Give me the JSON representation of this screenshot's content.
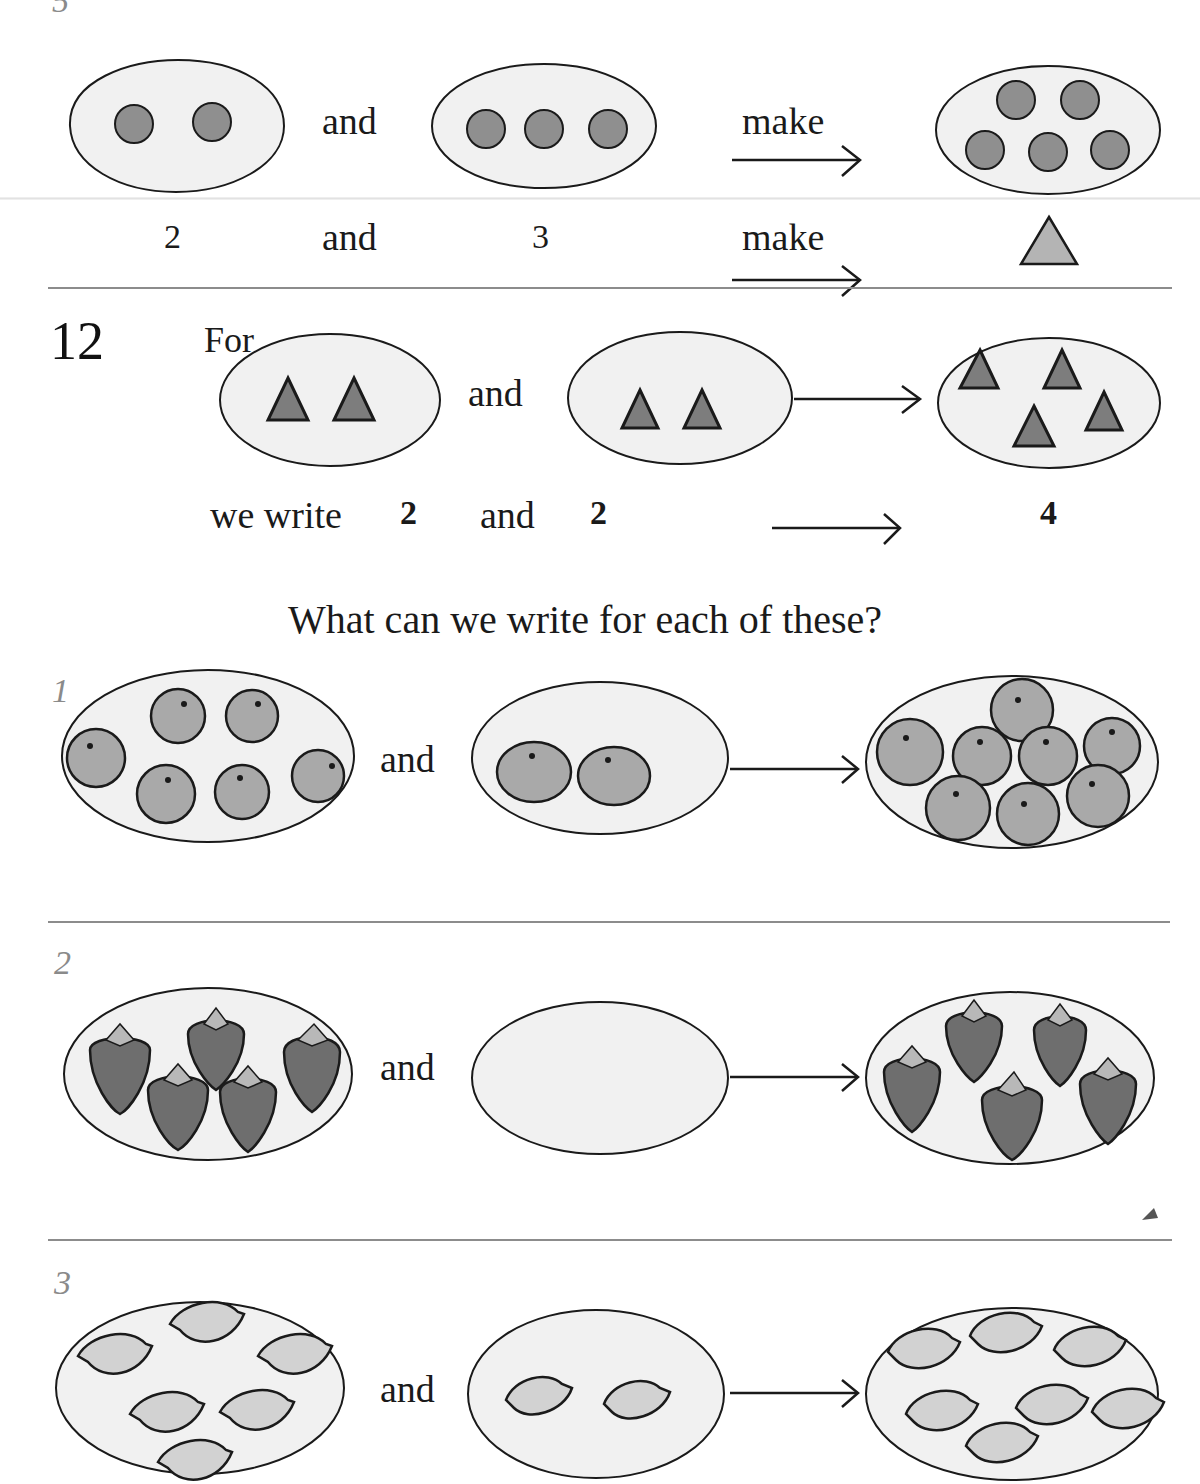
{
  "section_11_tail": {
    "label": "5",
    "row_pictures": {
      "left_count": 2,
      "joiner": "and",
      "middle_count": 3,
      "verb": "make",
      "result_count": 5,
      "object": "dot"
    },
    "row_numbers": {
      "left": "2",
      "joiner": "and",
      "middle": "3",
      "verb": "make",
      "result_symbol": "triangle-placeholder"
    }
  },
  "section_12": {
    "number": "12",
    "intro": "For",
    "joiner": "and",
    "pictures": {
      "left_count": 2,
      "middle_count": 2,
      "result_count": 4,
      "object": "triangle"
    },
    "written": {
      "prefix": "we write",
      "left": "2",
      "joiner": "and",
      "middle": "2",
      "result": "4"
    }
  },
  "prompt": "What can we write for each of these?",
  "exercises": [
    {
      "label": "1",
      "object": "orange",
      "left_count": 6,
      "joiner": "and",
      "middle_count": 2,
      "result_count": 8
    },
    {
      "label": "2",
      "object": "strawberry",
      "left_count": 5,
      "joiner": "and",
      "middle_count": 0,
      "result_count": 5
    },
    {
      "label": "3",
      "object": "lemon",
      "left_count": 6,
      "joiner": "and",
      "middle_count": 2,
      "result_count": 8
    }
  ],
  "colors": {
    "oval_fill": "#f1f1f1",
    "outline": "#1a1a1a",
    "dot_fill": "#8f8f8f",
    "triangle_fill": "#7d7d7d",
    "triangle_light": "#b4b4b4",
    "orange_fill": "#a9a9a9",
    "strawberry_fill": "#6e6e6e",
    "leaf_fill": "#b8b8b8",
    "lemon_fill": "#d2d2d2",
    "rule": "#8c8c8c",
    "label_grey": "#8a8a8a"
  }
}
